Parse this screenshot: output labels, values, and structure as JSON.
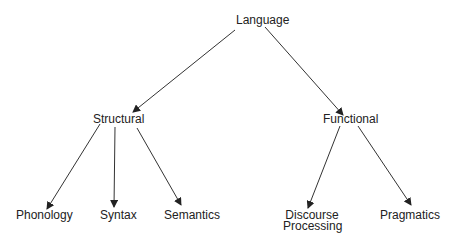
{
  "nodes": {
    "root": {
      "label": "Language"
    },
    "structural": {
      "label": "Structural"
    },
    "functional": {
      "label": "Functional"
    },
    "phonology": {
      "label": "Phonology"
    },
    "syntax": {
      "label": "Syntax"
    },
    "semantics": {
      "label": "Semantics"
    },
    "discourse": {
      "line1": "Discourse",
      "line2": "Processing"
    },
    "pragmatics": {
      "label": "Pragmatics"
    }
  },
  "edges": [
    [
      "Language",
      "Structural"
    ],
    [
      "Language",
      "Functional"
    ],
    [
      "Structural",
      "Phonology"
    ],
    [
      "Structural",
      "Syntax"
    ],
    [
      "Structural",
      "Semantics"
    ],
    [
      "Functional",
      "Discourse Processing"
    ],
    [
      "Functional",
      "Pragmatics"
    ]
  ]
}
